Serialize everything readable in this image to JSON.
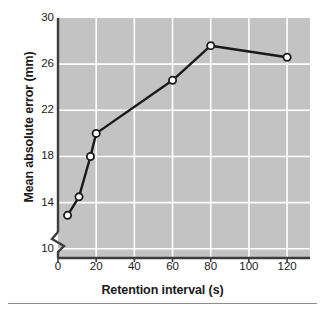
{
  "chart_data": {
    "type": "line",
    "title": "",
    "xlabel": "Retention interval (s)",
    "ylabel": "Mean absolute error (mm)",
    "xlim": [
      0,
      132
    ],
    "ylim": [
      9.2,
      30
    ],
    "xticks": [
      0,
      20,
      40,
      60,
      80,
      100,
      120
    ],
    "xticklabels": [
      "0",
      "20",
      "40",
      "60",
      "80",
      "100",
      "120"
    ],
    "yticks": [
      10,
      14,
      18,
      22,
      26,
      30
    ],
    "yticklabels": [
      "10",
      "14",
      "18",
      "22",
      "26",
      "30"
    ],
    "grid": true,
    "grid_color": "#ffffff",
    "plot_background": "#c3c3c3",
    "legend": null,
    "axis_break": true,
    "axis_break_note": "y-axis break below 10",
    "series": [
      {
        "name": "Mean absolute error",
        "line_color": "#1a1a1a",
        "marker": "circle-open",
        "marker_face_color": "#ffffff",
        "x": [
          5,
          11,
          17,
          20,
          60,
          80,
          120
        ],
        "y": [
          12.9,
          14.5,
          18.0,
          20.0,
          24.6,
          27.6,
          26.6
        ]
      }
    ]
  },
  "figure": {
    "y_axis_label": "Mean absolute error (mm)",
    "x_axis_label": "Retention interval (s)"
  }
}
